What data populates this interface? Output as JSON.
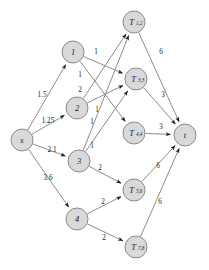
{
  "figure": {
    "type": "directed-flow-network-diagram",
    "background_color": "#ffffff",
    "node_fill": "#d9d9d9",
    "node_stroke": "#8a8a8a",
    "edge_color": "#8c8c8c",
    "text_color": "#1a1a1a"
  },
  "nodes": {
    "s": {
      "label": "s",
      "sub": "",
      "x": 22,
      "y": 140,
      "r": 11
    },
    "n1": {
      "label": "1",
      "sub": "",
      "x": 73,
      "y": 52,
      "r": 11
    },
    "n2": {
      "label": "2",
      "sub": "",
      "x": 77,
      "y": 108,
      "r": 11
    },
    "n3": {
      "label": "3",
      "sub": "",
      "x": 79,
      "y": 161,
      "r": 11
    },
    "n4": {
      "label": "4",
      "sub": "",
      "x": 77,
      "y": 219,
      "r": 11
    },
    "t12": {
      "label": "T",
      "sub": "1,2",
      "x": 134,
      "y": 22,
      "r": 11
    },
    "t33": {
      "label": "T",
      "sub": "3,3",
      "x": 136,
      "y": 79,
      "r": 11
    },
    "t44": {
      "label": "T",
      "sub": "4,4",
      "x": 134,
      "y": 133,
      "r": 11
    },
    "t56": {
      "label": "T",
      "sub": "5,6",
      "x": 134,
      "y": 190,
      "r": 11
    },
    "t78": {
      "label": "T",
      "sub": "7,8",
      "x": 136,
      "y": 247,
      "r": 11
    },
    "t": {
      "label": "t",
      "sub": "",
      "x": 185,
      "y": 135,
      "r": 11
    }
  },
  "edges": [
    {
      "id": "s-1",
      "from": "s",
      "to": "n1",
      "weight": "1.5",
      "lx": 42,
      "ly": 95
    },
    {
      "id": "s-2",
      "from": "s",
      "to": "n2",
      "weight": "1.25",
      "lx": 48,
      "ly": 121
    },
    {
      "id": "s-3",
      "from": "s",
      "to": "n3",
      "weight": "2.1",
      "lx": 52,
      "ly": 150
    },
    {
      "id": "s-4",
      "from": "s",
      "to": "n4",
      "weight": "3.6",
      "lx": 48,
      "ly": 178
    },
    {
      "id": "1-t33",
      "from": "n1",
      "to": "t33",
      "weight": "1",
      "lx": 96,
      "ly": 52
    },
    {
      "id": "1-t44",
      "from": "n1",
      "to": "t44",
      "weight": "1",
      "lx": 80,
      "ly": 75
    },
    {
      "id": "2-t12",
      "from": "n2",
      "to": "t12",
      "weight": "2",
      "lx": 80,
      "ly": 90
    },
    {
      "id": "2-t33",
      "from": "n2",
      "to": "t33",
      "weight": "1",
      "lx": 97,
      "ly": 110
    },
    {
      "id": "3-t12",
      "from": "n3",
      "to": "t12",
      "weight": "1",
      "lx": 92,
      "ly": 122
    },
    {
      "id": "3-t33",
      "from": "n3",
      "to": "t33",
      "weight": "1",
      "lx": 92,
      "ly": 146
    },
    {
      "id": "3-t56",
      "from": "n3",
      "to": "t56",
      "weight": "2",
      "lx": 100,
      "ly": 168
    },
    {
      "id": "4-t56",
      "from": "n4",
      "to": "t56",
      "weight": "2",
      "lx": 103,
      "ly": 202
    },
    {
      "id": "4-t78",
      "from": "n4",
      "to": "t78",
      "weight": "2",
      "lx": 104,
      "ly": 238
    },
    {
      "id": "t12-t",
      "from": "t12",
      "to": "t",
      "weight": "6",
      "lx": 161,
      "ly": 52
    },
    {
      "id": "t33-t",
      "from": "t33",
      "to": "t",
      "weight": "3",
      "lx": 163,
      "ly": 95
    },
    {
      "id": "t44-t",
      "from": "t44",
      "to": "t",
      "weight": "3",
      "lx": 161,
      "ly": 127
    },
    {
      "id": "t56-t",
      "from": "t56",
      "to": "t",
      "weight": "6",
      "lx": 158,
      "ly": 166
    },
    {
      "id": "t78-t",
      "from": "t78",
      "to": "t",
      "weight": "6",
      "lx": 160,
      "ly": 202
    }
  ]
}
